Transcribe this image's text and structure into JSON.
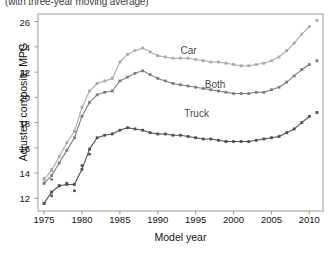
{
  "chart_data": {
    "type": "line",
    "title": "",
    "subtitle": "(with three-year moving average)",
    "xlabel": "Model year",
    "ylabel": "Adjusted composite MPG",
    "xlim": [
      1974.2,
      2011.8
    ],
    "ylim": [
      11.0,
      26.6
    ],
    "xticks": [
      1975,
      1980,
      1985,
      1990,
      1995,
      2000,
      2005,
      2010
    ],
    "yticks": [
      12,
      14,
      16,
      18,
      20,
      22,
      24,
      26
    ],
    "grid": false,
    "legend_position": "inline-annotations",
    "marker": "small-square",
    "colors": {
      "car": "#a8a8a8",
      "both": "#7c7c7c",
      "truck": "#4f4f4f",
      "axis": "#9a9a9a",
      "text": "#111111"
    },
    "annotations": [
      {
        "label": "Car",
        "x": 1993.0,
        "y": 23.6
      },
      {
        "label": "Both",
        "x": 1996.2,
        "y": 20.9
      },
      {
        "label": "Truck",
        "x": 1993.5,
        "y": 18.6
      }
    ],
    "x": [
      1975,
      1976,
      1977,
      1978,
      1979,
      1980,
      1981,
      1982,
      1983,
      1984,
      1985,
      1986,
      1987,
      1988,
      1989,
      1990,
      1991,
      1992,
      1993,
      1994,
      1995,
      1996,
      1997,
      1998,
      1999,
      2000,
      2001,
      2002,
      2003,
      2004,
      2005,
      2006,
      2007,
      2008,
      2009,
      2010
    ],
    "series": [
      {
        "name": "Car",
        "values": [
          13.5,
          14.2,
          15.3,
          16.4,
          17.3,
          19.2,
          20.5,
          21.1,
          21.3,
          21.5,
          22.8,
          23.4,
          23.7,
          23.9,
          23.6,
          23.3,
          23.2,
          23.1,
          23.1,
          23.1,
          23.0,
          22.9,
          22.8,
          22.8,
          22.7,
          22.6,
          22.5,
          22.5,
          22.6,
          22.7,
          22.9,
          23.2,
          23.7,
          24.3,
          25.0,
          25.6
        ],
        "isolated_points": [
          {
            "x": 2011,
            "y": 26.1
          }
        ]
      },
      {
        "name": "Both",
        "values": [
          13.2,
          13.8,
          14.8,
          15.8,
          16.8,
          18.5,
          19.6,
          20.2,
          20.4,
          20.5,
          21.3,
          21.6,
          21.9,
          22.1,
          21.8,
          21.5,
          21.3,
          21.1,
          21.0,
          20.9,
          20.8,
          20.7,
          20.6,
          20.5,
          20.4,
          20.3,
          20.3,
          20.3,
          20.4,
          20.4,
          20.6,
          20.8,
          21.2,
          21.7,
          22.2,
          22.6
        ],
        "isolated_points": [
          {
            "x": 2011,
            "y": 22.9
          }
        ]
      },
      {
        "name": "Truck",
        "values": [
          11.6,
          12.5,
          13.0,
          13.1,
          13.1,
          14.3,
          15.9,
          16.8,
          17.0,
          17.1,
          17.4,
          17.6,
          17.5,
          17.4,
          17.2,
          17.1,
          17.1,
          17.0,
          17.0,
          16.9,
          16.8,
          16.7,
          16.7,
          16.6,
          16.5,
          16.5,
          16.5,
          16.5,
          16.6,
          16.7,
          16.8,
          16.9,
          17.2,
          17.5,
          18.0,
          18.5
        ],
        "isolated_points": [
          {
            "x": 2011,
            "y": 18.8
          }
        ]
      }
    ],
    "raw_scatter": [
      {
        "series": "Car",
        "x": 1975,
        "y": 13.6
      },
      {
        "series": "Car",
        "x": 1976,
        "y": 14.3
      },
      {
        "series": "Both",
        "x": 1975,
        "y": 13.2
      },
      {
        "series": "Both",
        "x": 1976,
        "y": 13.5
      },
      {
        "series": "Truck",
        "x": 1975,
        "y": 11.6
      },
      {
        "series": "Truck",
        "x": 1976,
        "y": 12.2
      },
      {
        "series": "Truck",
        "x": 1977,
        "y": 13.0
      },
      {
        "series": "Truck",
        "x": 1978,
        "y": 13.2
      },
      {
        "series": "Truck",
        "x": 1979,
        "y": 12.6
      },
      {
        "series": "Truck",
        "x": 1980,
        "y": 14.6
      },
      {
        "series": "Truck",
        "x": 1981,
        "y": 15.5
      }
    ]
  }
}
